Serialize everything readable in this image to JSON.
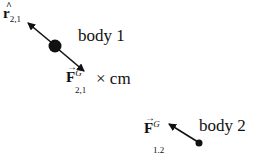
{
  "diagram": {
    "body1": {
      "label": "body 1"
    },
    "body2": {
      "label": "body 2"
    },
    "unit_vector": {
      "symbol": "r",
      "accent": "^",
      "subscript": "2,1"
    },
    "force_21": {
      "symbol": "F",
      "accent": "→",
      "superscript": "G",
      "subscript": "2,1",
      "suffix": "× cm"
    },
    "force_12": {
      "symbol": "F",
      "accent": "→",
      "superscript": "G",
      "subscript": "1,2"
    },
    "colors": {
      "ink": "#111111",
      "background": "#ffffff"
    }
  }
}
